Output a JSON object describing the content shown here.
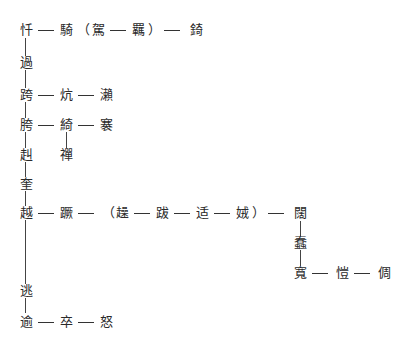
{
  "diagram": {
    "type": "character-derivation-tree",
    "rows": [
      {
        "id": "r1",
        "nodes": [
          "忏",
          "騎",
          "駕",
          "羈",
          "錡"
        ],
        "group": {
          "open": "（",
          "close": "）",
          "members": [
            "駕",
            "羈"
          ]
        }
      },
      {
        "id": "r2",
        "nodes": [
          "過"
        ]
      },
      {
        "id": "r3",
        "nodes": [
          "跨",
          "炕",
          "瀨"
        ]
      },
      {
        "id": "r4",
        "nodes": [
          "胯",
          "綺",
          "褰"
        ]
      },
      {
        "id": "r5",
        "nodes": [
          "赳",
          "禪"
        ]
      },
      {
        "id": "r6",
        "nodes": [
          "奎"
        ]
      },
      {
        "id": "r7",
        "nodes": [
          "越",
          "蹶",
          "趮",
          "跋",
          "适",
          "娀",
          "闊"
        ],
        "group": {
          "open": "（",
          "close": "）",
          "members": [
            "趮",
            "跋",
            "适",
            "娀"
          ]
        }
      },
      {
        "id": "r8",
        "nodes": [
          "蠢"
        ]
      },
      {
        "id": "r9",
        "nodes": [
          "寬",
          "愷",
          "倜"
        ]
      },
      {
        "id": "r10",
        "nodes": [
          "逃"
        ]
      },
      {
        "id": "r11",
        "nodes": [
          "逾",
          "卒",
          "怒"
        ]
      }
    ],
    "chars": {
      "c1": "忏",
      "c2": "騎",
      "c3": "駕",
      "c4": "羈",
      "c5": "錡",
      "c6": "過",
      "c7": "跨",
      "c8": "炕",
      "c9": "瀨",
      "c10": "胯",
      "c11": "綺",
      "c12": "褰",
      "c13": "赳",
      "c14": "禪",
      "c15": "奎",
      "c16": "越",
      "c17": "蹶",
      "c18": "趮",
      "c19": "跋",
      "c20": "适",
      "c21": "娀",
      "c22": "闊",
      "c23": "蠢",
      "c24": "寬",
      "c25": "愷",
      "c26": "倜",
      "c27": "逃",
      "c28": "逾",
      "c29": "卒",
      "c30": "怒"
    },
    "punct": {
      "open": "（",
      "close": "）"
    }
  }
}
